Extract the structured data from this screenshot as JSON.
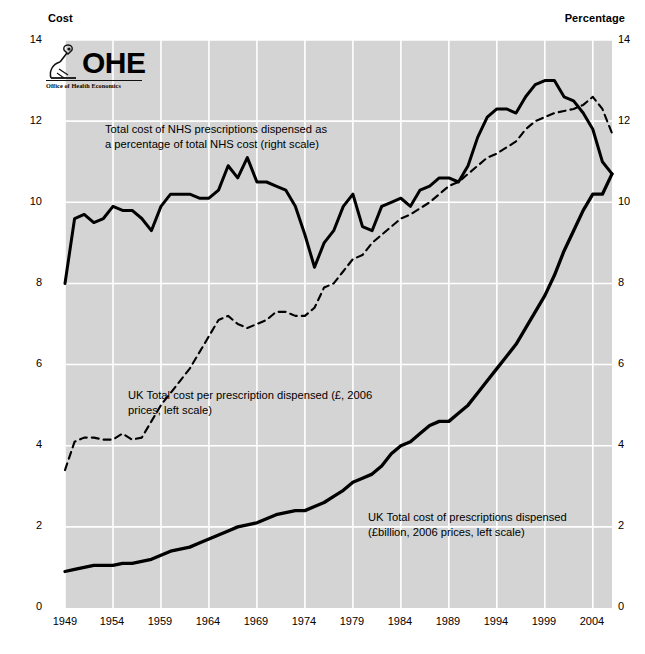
{
  "axes": {
    "left_title": "Cost",
    "right_title": "Percentage",
    "left_ticks": [
      "14",
      "12",
      "10",
      "8",
      "6",
      "4",
      "2",
      "0"
    ],
    "right_ticks": [
      "14",
      "12",
      "10",
      "8",
      "6",
      "4",
      "2",
      "0"
    ],
    "x_ticks": [
      "1949",
      "1954",
      "1959",
      "1964",
      "1969",
      "1974",
      "1979",
      "1984",
      "1989",
      "1994",
      "1999",
      "2004"
    ]
  },
  "logo": {
    "name": "OHE",
    "subtitle": "Office of Health Economics",
    "icon": "microscope-icon"
  },
  "annotations": {
    "percentage": "Total cost of NHS prescriptions dispensed as\na percentage of total NHS cost (right scale)",
    "cost_per_prescription": "UK Total cost per prescription dispensed (£, 2006\nprices, left scale)",
    "total_cost": "UK Total cost of prescriptions dispensed\n(£billion, 2006 prices, left scale)"
  },
  "colors": {
    "plot_background": "#d4d4d4",
    "gridline": "#ffffff",
    "series_line": "#000000",
    "text": "#000000"
  },
  "chart_data": {
    "type": "line",
    "title": "",
    "xlabel": "",
    "ylabel": "Cost",
    "y2label": "Percentage",
    "xlim": [
      1949,
      2006
    ],
    "ylim": [
      0,
      14
    ],
    "y2lim": [
      0,
      14
    ],
    "grid": true,
    "legend": "annotations-inline",
    "x": [
      1949,
      1950,
      1951,
      1952,
      1953,
      1954,
      1955,
      1956,
      1957,
      1958,
      1959,
      1960,
      1961,
      1962,
      1963,
      1964,
      1965,
      1966,
      1967,
      1968,
      1969,
      1970,
      1971,
      1972,
      1973,
      1974,
      1975,
      1976,
      1977,
      1978,
      1979,
      1980,
      1981,
      1982,
      1983,
      1984,
      1985,
      1986,
      1987,
      1988,
      1989,
      1990,
      1991,
      1992,
      1993,
      1994,
      1995,
      1996,
      1997,
      1998,
      1999,
      2000,
      2001,
      2002,
      2003,
      2004,
      2005,
      2006
    ],
    "series": [
      {
        "name": "Total cost of NHS prescriptions dispensed as a percentage of total NHS cost (right scale)",
        "axis": "right",
        "style": "solid",
        "units": "%",
        "values": [
          8.0,
          9.6,
          9.7,
          9.5,
          9.6,
          9.9,
          9.8,
          9.8,
          9.6,
          9.3,
          9.9,
          10.2,
          10.2,
          10.2,
          10.1,
          10.1,
          10.3,
          10.9,
          10.6,
          11.1,
          10.5,
          10.5,
          10.4,
          10.3,
          9.9,
          9.2,
          8.4,
          9.0,
          9.3,
          9.9,
          10.2,
          9.4,
          9.3,
          9.9,
          10.0,
          10.1,
          9.9,
          10.3,
          10.4,
          10.6,
          10.6,
          10.5,
          10.9,
          11.6,
          12.1,
          12.3,
          12.3,
          12.2,
          12.6,
          12.9,
          13.0,
          13.0,
          12.6,
          12.5,
          12.2,
          11.8,
          11.0,
          10.7
        ]
      },
      {
        "name": "UK Total cost per prescription dispensed (£, 2006 prices, left scale)",
        "axis": "left",
        "style": "dashed",
        "units": "£",
        "values": [
          3.4,
          4.1,
          4.2,
          4.2,
          4.15,
          4.15,
          4.3,
          4.15,
          4.2,
          4.6,
          5.0,
          5.3,
          5.6,
          5.9,
          6.3,
          6.7,
          7.1,
          7.2,
          7.0,
          6.9,
          7.0,
          7.1,
          7.3,
          7.3,
          7.2,
          7.2,
          7.4,
          7.9,
          8.0,
          8.3,
          8.6,
          8.7,
          9.0,
          9.2,
          9.4,
          9.6,
          9.7,
          9.85,
          10.0,
          10.2,
          10.4,
          10.5,
          10.7,
          10.9,
          11.1,
          11.2,
          11.35,
          11.5,
          11.8,
          12.0,
          12.1,
          12.2,
          12.25,
          12.3,
          12.4,
          12.6,
          12.3,
          11.7
        ]
      },
      {
        "name": "UK Total cost of prescriptions dispensed (£billion, 2006 prices, left scale)",
        "axis": "left",
        "style": "solid-thick",
        "units": "£bn",
        "values": [
          0.9,
          0.95,
          1.0,
          1.05,
          1.05,
          1.05,
          1.1,
          1.1,
          1.15,
          1.2,
          1.3,
          1.4,
          1.45,
          1.5,
          1.6,
          1.7,
          1.8,
          1.9,
          2.0,
          2.05,
          2.1,
          2.2,
          2.3,
          2.35,
          2.4,
          2.4,
          2.5,
          2.6,
          2.75,
          2.9,
          3.1,
          3.2,
          3.3,
          3.5,
          3.8,
          4.0,
          4.1,
          4.3,
          4.5,
          4.6,
          4.6,
          4.8,
          5.0,
          5.3,
          5.6,
          5.9,
          6.2,
          6.5,
          6.9,
          7.3,
          7.7,
          8.2,
          8.8,
          9.3,
          9.8,
          10.2,
          10.2,
          10.7
        ]
      }
    ]
  }
}
